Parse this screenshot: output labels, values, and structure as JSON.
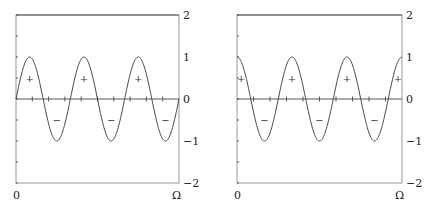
{
  "chart_data": [
    {
      "type": "line",
      "title": "",
      "function": "sin(6*pi*x/Omega)",
      "xlabel": "",
      "ylabel": "",
      "x_tick_labels": [
        "0",
        "Ω"
      ],
      "y_tick_labels": [
        "2",
        "1",
        "0",
        "−1",
        "−2"
      ],
      "y_ticks": [
        2,
        1,
        0,
        -1,
        -2
      ],
      "xlim": [
        0,
        1
      ],
      "ylim": [
        -2,
        2
      ],
      "periods": 3,
      "phase": "sine",
      "sign_markers": [
        {
          "x": 0.0833,
          "y": 0.5,
          "label": "+"
        },
        {
          "x": 0.25,
          "y": -0.5,
          "label": "−"
        },
        {
          "x": 0.4167,
          "y": 0.5,
          "label": "+"
        },
        {
          "x": 0.5833,
          "y": -0.5,
          "label": "−"
        },
        {
          "x": 0.75,
          "y": 0.5,
          "label": "+"
        },
        {
          "x": 0.9167,
          "y": -0.5,
          "label": "−"
        }
      ],
      "grid": false,
      "legend": null
    },
    {
      "type": "line",
      "title": "",
      "function": "cos(6*pi*x/Omega)",
      "xlabel": "",
      "ylabel": "",
      "x_tick_labels": [
        "0",
        "Ω"
      ],
      "y_tick_labels": [
        "2",
        "1",
        "0",
        "−1",
        "−2"
      ],
      "y_ticks": [
        2,
        1,
        0,
        -1,
        -2
      ],
      "xlim": [
        0,
        1
      ],
      "ylim": [
        -2,
        2
      ],
      "periods": 3,
      "phase": "cosine",
      "sign_markers": [
        {
          "x": 0.025,
          "y": 0.5,
          "label": "+"
        },
        {
          "x": 0.1667,
          "y": -0.5,
          "label": "−"
        },
        {
          "x": 0.3333,
          "y": 0.5,
          "label": "+"
        },
        {
          "x": 0.5,
          "y": -0.5,
          "label": "−"
        },
        {
          "x": 0.6667,
          "y": 0.5,
          "label": "+"
        },
        {
          "x": 0.8333,
          "y": -0.5,
          "label": "−"
        },
        {
          "x": 0.975,
          "y": 0.5,
          "label": "+"
        }
      ],
      "grid": false,
      "legend": null
    }
  ],
  "plots": [
    {
      "x_min_label": "0",
      "x_max_label": "Ω",
      "y_labels": {
        "top": "2",
        "one": "1",
        "zero": "0",
        "neg_one": "−1",
        "bottom": "−2"
      }
    },
    {
      "x_min_label": "0",
      "x_max_label": "Ω",
      "y_labels": {
        "top": "2",
        "one": "1",
        "zero": "0",
        "neg_one": "−1",
        "bottom": "−2"
      }
    }
  ],
  "colors": {
    "frame": "#9a9a9a",
    "axis_line": "#555555",
    "curve": "#444444",
    "text": "#222222"
  }
}
